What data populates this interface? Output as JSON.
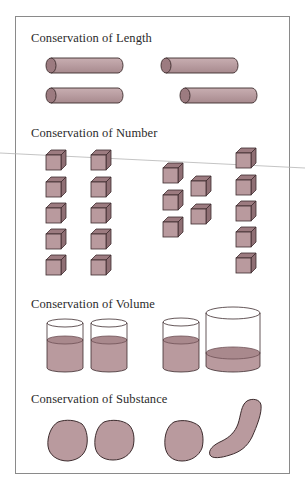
{
  "figure": {
    "sections": [
      {
        "id": "length",
        "title": "Conservation of Length"
      },
      {
        "id": "number",
        "title": "Conservation of Number"
      },
      {
        "id": "volume",
        "title": "Conservation of Volume"
      },
      {
        "id": "substance",
        "title": "Conservation of Substance"
      }
    ],
    "colors": {
      "fill": "#b99a9e",
      "fill_dark": "#9c7b80",
      "fill_light": "#c9adb0",
      "outline": "#3d2c2e",
      "frame": "#8a8a8a",
      "text": "#2b2b2b"
    },
    "length": {
      "rods": [
        {
          "x": 46,
          "y": 58,
          "w": 77
        },
        {
          "x": 161,
          "y": 58,
          "w": 77
        },
        {
          "x": 46,
          "y": 88,
          "w": 77
        },
        {
          "x": 180,
          "y": 88,
          "w": 77
        }
      ]
    },
    "number": {
      "left_row_count": 10,
      "right_row_count": 10,
      "cubes": [
        [
          46,
          150
        ],
        [
          46,
          177
        ],
        [
          46,
          203
        ],
        [
          46,
          229
        ],
        [
          46,
          255
        ],
        [
          91,
          150
        ],
        [
          91,
          177
        ],
        [
          91,
          203
        ],
        [
          91,
          229
        ],
        [
          91,
          255
        ],
        [
          163,
          163
        ],
        [
          163,
          190
        ],
        [
          163,
          217
        ],
        [
          191,
          176
        ],
        [
          191,
          204
        ],
        [
          236,
          148
        ],
        [
          236,
          175
        ],
        [
          236,
          201
        ],
        [
          236,
          227
        ],
        [
          236,
          253
        ]
      ]
    },
    "volume": {
      "beakers": [
        {
          "x": 47,
          "top": 323,
          "bottom": 372,
          "w": 36,
          "liquid": 340
        },
        {
          "x": 91,
          "top": 323,
          "bottom": 372,
          "w": 36,
          "liquid": 340
        },
        {
          "x": 163,
          "top": 322,
          "bottom": 372,
          "w": 36,
          "liquid": 340
        },
        {
          "x": 206,
          "top": 313,
          "bottom": 372,
          "w": 54,
          "liquid": 353
        }
      ]
    },
    "substance": {
      "items": [
        "ball",
        "ball",
        "ball",
        "sausage"
      ]
    }
  }
}
